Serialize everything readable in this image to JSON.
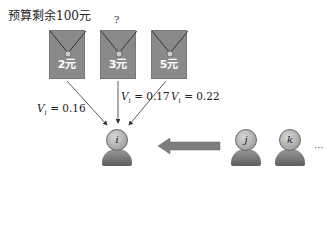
{
  "title": "预算剩余100元",
  "question_mark": "?",
  "envelopes": [
    {
      "amount": "2元"
    },
    {
      "amount": "3元"
    },
    {
      "amount": "5元"
    }
  ],
  "values": [
    {
      "var": "V",
      "sub": "i",
      "eq": " = 0.16"
    },
    {
      "var": "V",
      "sub": "i",
      "eq": " = 0.17"
    },
    {
      "var": "V",
      "sub": "i",
      "eq": " = 0.22"
    }
  ],
  "people": [
    {
      "label": "i"
    },
    {
      "label": "j"
    },
    {
      "label": "k"
    }
  ],
  "ellipsis": "···",
  "colors": {
    "envelope": "#8a8a8a",
    "arrow": "#7d7d7d"
  }
}
